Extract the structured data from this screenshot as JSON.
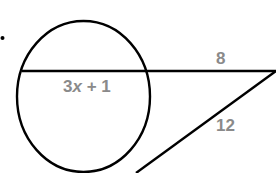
{
  "diagram": {
    "type": "circle-secant-tangent",
    "bullet": "•",
    "labels": {
      "chord": {
        "coef": "3",
        "var": "x",
        "rest": " + 1"
      },
      "external_secant": "8",
      "tangent": "12"
    },
    "colors": {
      "stroke": "#000000",
      "label": "#8a8a8a",
      "background": "#ffffff"
    }
  }
}
